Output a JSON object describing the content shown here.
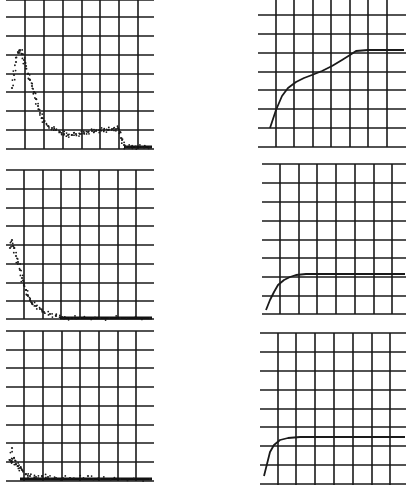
{
  "chart_data": [
    {
      "id": "top-left",
      "type": "scatter",
      "title": "",
      "xlabel": "",
      "ylabel": "",
      "grid": true,
      "description": "Dotted scatter: sharp peak near left, decays to a plateau, then abrupt drop to baseline",
      "box": {
        "x": 6,
        "y": 0,
        "w": 148,
        "h": 149
      },
      "vlines": [
        25,
        44,
        63,
        82,
        100,
        119,
        138
      ],
      "hlines": [
        0,
        17,
        36,
        55,
        74,
        92,
        111,
        130,
        149
      ],
      "points": [
        [
          12,
          88
        ],
        [
          14,
          75
        ],
        [
          16,
          62
        ],
        [
          18,
          52
        ],
        [
          20,
          50
        ],
        [
          22,
          54
        ],
        [
          24,
          60
        ],
        [
          26,
          66
        ],
        [
          28,
          74
        ],
        [
          30,
          80
        ],
        [
          32,
          86
        ],
        [
          34,
          92
        ],
        [
          36,
          99
        ],
        [
          38,
          106
        ],
        [
          40,
          113
        ],
        [
          42,
          118
        ],
        [
          44,
          122
        ],
        [
          48,
          126
        ],
        [
          52,
          128
        ],
        [
          56,
          130
        ],
        [
          60,
          132
        ],
        [
          64,
          134
        ],
        [
          68,
          135
        ],
        [
          72,
          135
        ],
        [
          76,
          134
        ],
        [
          80,
          134
        ],
        [
          84,
          133
        ],
        [
          88,
          132
        ],
        [
          92,
          131
        ],
        [
          96,
          131
        ],
        [
          100,
          130
        ],
        [
          104,
          130
        ],
        [
          108,
          130
        ],
        [
          112,
          129
        ],
        [
          116,
          129
        ],
        [
          118,
          128
        ],
        [
          120,
          132
        ],
        [
          122,
          140
        ],
        [
          124,
          145
        ],
        [
          126,
          147
        ],
        [
          130,
          147
        ],
        [
          136,
          147
        ],
        [
          142,
          147
        ],
        [
          150,
          147
        ]
      ],
      "baseline": [
        [
          124,
          147
        ],
        [
          152,
          147
        ]
      ]
    },
    {
      "id": "top-right",
      "type": "line",
      "title": "",
      "xlabel": "",
      "ylabel": "",
      "grid": true,
      "description": "Rising curve: steep rise, slope change to gentle rise, then flat plateau",
      "box": {
        "x": 258,
        "y": 0,
        "w": 148,
        "h": 147
      },
      "vlines": [
        276,
        294,
        313,
        331,
        350,
        368,
        387
      ],
      "hlines": [
        15,
        34,
        53,
        72,
        90,
        109,
        128,
        147
      ],
      "points": [
        [
          270,
          128
        ],
        [
          276,
          110
        ],
        [
          282,
          96
        ],
        [
          288,
          88
        ],
        [
          296,
          82
        ],
        [
          304,
          78
        ],
        [
          312,
          75
        ],
        [
          322,
          71
        ],
        [
          332,
          66
        ],
        [
          342,
          60
        ],
        [
          350,
          55
        ],
        [
          356,
          51
        ],
        [
          368,
          50
        ],
        [
          386,
          50
        ],
        [
          404,
          50
        ]
      ]
    },
    {
      "id": "middle-left",
      "type": "scatter",
      "title": "",
      "xlabel": "",
      "ylabel": "",
      "grid": true,
      "description": "Dotted scatter decaying exponentially from upper-left to flat baseline",
      "box": {
        "x": 6,
        "y": 170,
        "w": 148,
        "h": 149
      },
      "vlines": [
        24,
        43,
        61,
        80,
        99,
        118,
        136
      ],
      "hlines": [
        170,
        189,
        208,
        226,
        245,
        264,
        283,
        301,
        319
      ],
      "points": [
        [
          10,
          248
        ],
        [
          12,
          240
        ],
        [
          14,
          248
        ],
        [
          16,
          256
        ],
        [
          18,
          262
        ],
        [
          20,
          270
        ],
        [
          22,
          278
        ],
        [
          24,
          284
        ],
        [
          26,
          290
        ],
        [
          28,
          296
        ],
        [
          30,
          300
        ],
        [
          32,
          303
        ],
        [
          36,
          306
        ],
        [
          40,
          309
        ],
        [
          44,
          312
        ],
        [
          50,
          314
        ],
        [
          56,
          316
        ],
        [
          62,
          317
        ],
        [
          70,
          318
        ],
        [
          80,
          318
        ],
        [
          100,
          318
        ],
        [
          120,
          318
        ],
        [
          150,
          318
        ]
      ],
      "baseline": [
        [
          60,
          318
        ],
        [
          152,
          318
        ]
      ]
    },
    {
      "id": "middle-right",
      "type": "line",
      "title": "",
      "xlabel": "",
      "ylabel": "",
      "grid": true,
      "description": "Fast-rising curve saturating to a flat plateau",
      "box": {
        "x": 262,
        "y": 164,
        "w": 144,
        "h": 150
      },
      "vlines": [
        280,
        299,
        317,
        336,
        355,
        374,
        392
      ],
      "hlines": [
        164,
        183,
        202,
        221,
        240,
        258,
        277,
        296,
        314
      ],
      "points": [
        [
          266,
          310
        ],
        [
          270,
          300
        ],
        [
          274,
          292
        ],
        [
          278,
          285
        ],
        [
          284,
          280
        ],
        [
          290,
          277
        ],
        [
          296,
          275
        ],
        [
          306,
          274
        ],
        [
          330,
          274
        ],
        [
          360,
          274
        ],
        [
          405,
          274
        ]
      ]
    },
    {
      "id": "bottom-left",
      "type": "scatter",
      "title": "",
      "xlabel": "",
      "ylabel": "",
      "grid": true,
      "description": "Dotted scatter with few points near origin, quickly settling to baseline",
      "box": {
        "x": 6,
        "y": 331,
        "w": 148,
        "h": 150
      },
      "vlines": [
        24,
        43,
        62,
        80,
        99,
        118,
        136
      ],
      "hlines": [
        331,
        350,
        368,
        387,
        406,
        425,
        443,
        462,
        481
      ],
      "points": [
        [
          12,
          448
        ],
        [
          10,
          460
        ],
        [
          12,
          462
        ],
        [
          14,
          458
        ],
        [
          16,
          464
        ],
        [
          18,
          466
        ],
        [
          20,
          468
        ],
        [
          22,
          470
        ],
        [
          26,
          474
        ],
        [
          30,
          476
        ],
        [
          36,
          477
        ],
        [
          42,
          476
        ],
        [
          48,
          477
        ],
        [
          56,
          478
        ],
        [
          70,
          478
        ],
        [
          88,
          476
        ],
        [
          100,
          479
        ],
        [
          120,
          479
        ],
        [
          150,
          479
        ]
      ],
      "baseline": [
        [
          20,
          479
        ],
        [
          152,
          479
        ]
      ]
    },
    {
      "id": "bottom-right",
      "type": "line",
      "title": "",
      "xlabel": "",
      "ylabel": "",
      "grid": true,
      "description": "Very fast rise saturating to plateau",
      "box": {
        "x": 260,
        "y": 333,
        "w": 146,
        "h": 152
      },
      "vlines": [
        278,
        296,
        315,
        334,
        353,
        372,
        390
      ],
      "hlines": [
        333,
        352,
        371,
        390,
        409,
        427,
        446,
        465,
        484
      ],
      "points": [
        [
          264,
          476
        ],
        [
          267,
          464
        ],
        [
          270,
          452
        ],
        [
          274,
          445
        ],
        [
          280,
          440
        ],
        [
          288,
          438
        ],
        [
          300,
          437
        ],
        [
          330,
          437
        ],
        [
          360,
          437
        ],
        [
          405,
          437
        ]
      ]
    }
  ]
}
